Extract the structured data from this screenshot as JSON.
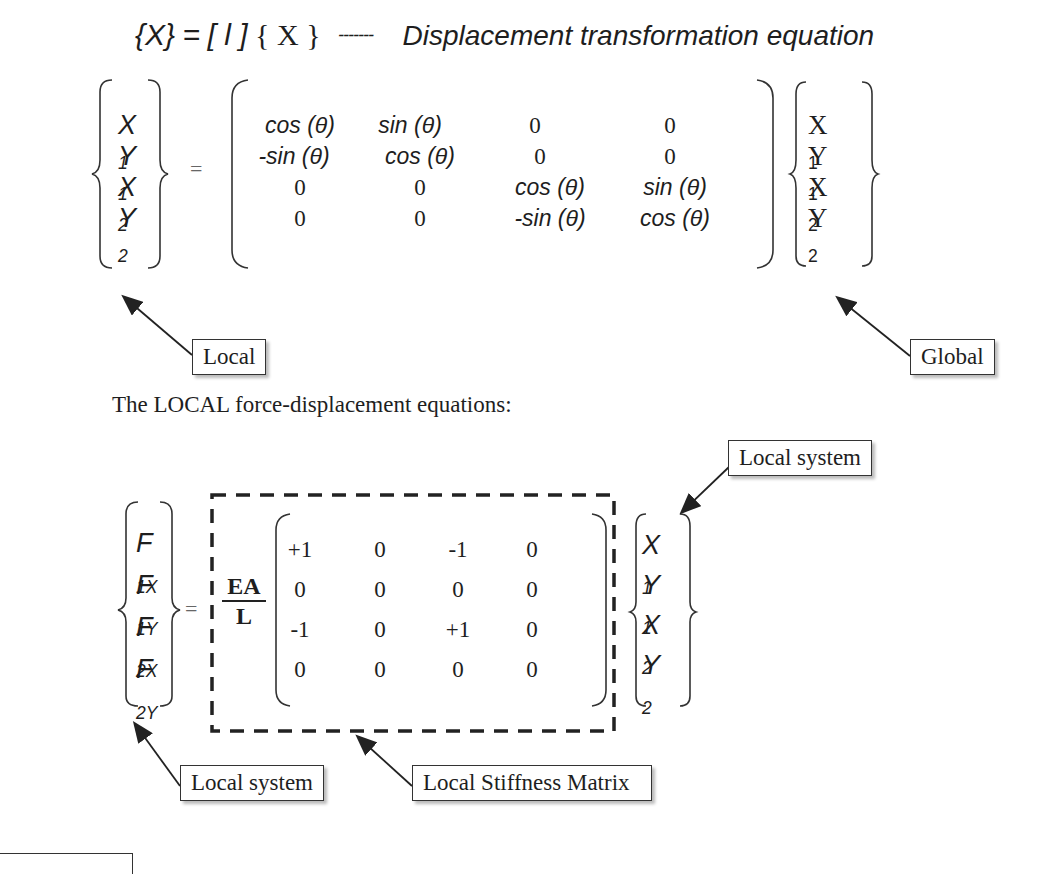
{
  "header": {
    "lhs": "{X}",
    "eq": "=",
    "matrix_symbol": "[ l ]",
    "rhs": "{ X }",
    "dashes": "-------",
    "description": "Displacement transformation equation"
  },
  "transform_eq": {
    "local_vector": [
      "X",
      "Y",
      "X",
      "Y"
    ],
    "local_subs": [
      "1",
      "1",
      "2",
      "2"
    ],
    "equals": "=",
    "matrix": [
      [
        "cos (θ)",
        "sin (θ)",
        "0",
        "0"
      ],
      [
        "-sin (θ)",
        "cos (θ)",
        "0",
        "0"
      ],
      [
        "0",
        "0",
        "cos (θ)",
        "sin (θ)"
      ],
      [
        "0",
        "0",
        "-sin (θ)",
        "cos (θ)"
      ]
    ],
    "global_vector": [
      "X",
      "Y",
      "X",
      "Y"
    ],
    "global_subs": [
      "1",
      "1",
      "2",
      "2"
    ],
    "callout_local": "Local",
    "callout_global": "Global"
  },
  "section_text": "The LOCAL force-displacement equations:",
  "stiffness_eq": {
    "force_vector": [
      "F",
      "F",
      "F",
      "F"
    ],
    "force_subs": [
      "1X",
      "1Y",
      "2X",
      "2Y"
    ],
    "equals": "=",
    "factor_num": "EA",
    "factor_den": "L",
    "matrix": [
      [
        "+1",
        "0",
        "-1",
        "0"
      ],
      [
        "0",
        "0",
        "0",
        "0"
      ],
      [
        "-1",
        "0",
        "+1",
        "0"
      ],
      [
        "0",
        "0",
        "0",
        "0"
      ]
    ],
    "disp_vector": [
      "X",
      "Y",
      "X",
      "Y"
    ],
    "disp_subs": [
      "1",
      "1",
      "2",
      "2"
    ],
    "callout_local_system_top": "Local system",
    "callout_local_system_bottom": "Local system",
    "callout_stiffness": "Local Stiffness Matrix"
  }
}
